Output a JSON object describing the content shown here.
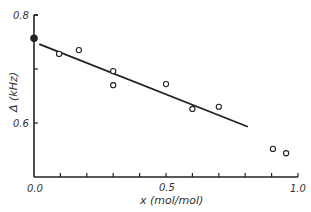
{
  "chart_data": {
    "type": "scatter",
    "title": "",
    "xlabel": "x (mol/mol)",
    "ylabel": "Δ (kHz)",
    "xlim": [
      0.0,
      1.0
    ],
    "ylim": [
      0.5,
      0.8
    ],
    "x_ticks": [
      0.0,
      0.1,
      0.2,
      0.3,
      0.4,
      0.5,
      0.6,
      0.7,
      0.8,
      0.9,
      1.0
    ],
    "x_tick_labels": [
      "0.0",
      "0.5",
      "1.0"
    ],
    "y_ticks": [
      0.6,
      0.7,
      0.8
    ],
    "y_tick_labels": [
      "0.6",
      "0.8"
    ],
    "grid": false,
    "legend": null,
    "series": [
      {
        "name": "filled point",
        "marker": "filled-circle",
        "points": [
          {
            "x": 0.0,
            "y": 0.757
          }
        ]
      },
      {
        "name": "measured",
        "marker": "open-circle",
        "points": [
          {
            "x": 0.095,
            "y": 0.728
          },
          {
            "x": 0.17,
            "y": 0.735
          },
          {
            "x": 0.3,
            "y": 0.696
          },
          {
            "x": 0.3,
            "y": 0.67
          },
          {
            "x": 0.5,
            "y": 0.672
          },
          {
            "x": 0.6,
            "y": 0.626
          },
          {
            "x": 0.7,
            "y": 0.63
          },
          {
            "x": 0.905,
            "y": 0.552
          },
          {
            "x": 0.955,
            "y": 0.544
          }
        ]
      }
    ],
    "fit_line": {
      "x1": 0.02,
      "y1": 0.746,
      "x2": 0.81,
      "y2": 0.593
    }
  },
  "labels": {
    "x_axis": "x (mol/mol)",
    "y_axis": "Δ (kHz)",
    "y_tick_08": "0.8",
    "y_tick_06": "0.6",
    "x_tick_00": "0.0",
    "x_tick_05": "0.5",
    "x_tick_10": "1.0"
  }
}
